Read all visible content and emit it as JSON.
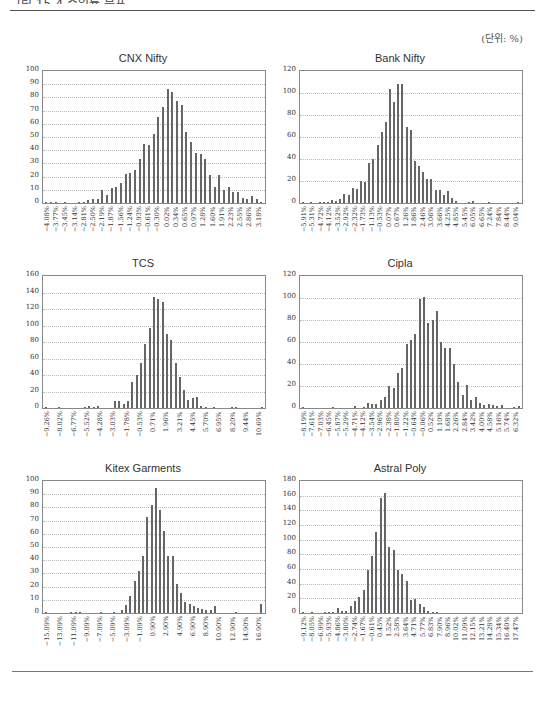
{
  "header": {
    "title_clipped": "그림 15-4 수익률 분포",
    "unit_label": "(단위: %)"
  },
  "chart_data": [
    {
      "id": "cnx",
      "type": "bar",
      "title": "CNX Nifty",
      "ylim": [
        0,
        100
      ],
      "yticks": [
        0,
        10,
        20,
        30,
        40,
        50,
        60,
        70,
        80,
        90,
        100
      ],
      "xlabels": [
        "-4.08%",
        "-3.77%",
        "-3.45%",
        "-3.14%",
        "-2.81%",
        "-2.50%",
        "-2.19%",
        "-1.87%",
        "-1.56%",
        "-1.24%",
        "-0.93%",
        "-0.61%",
        "-0.30%",
        "0.02%",
        "0.34%",
        "0.65%",
        "0.97%",
        "1.28%",
        "1.60%",
        "1.91%",
        "2.23%",
        "2.55%",
        "2.86%",
        "3.18%"
      ],
      "values": [
        1,
        1,
        1,
        0,
        1,
        0,
        0,
        1,
        1,
        2,
        3,
        3,
        10,
        6,
        11,
        12,
        15,
        22,
        23,
        25,
        33,
        45,
        44,
        52,
        65,
        73,
        86,
        84,
        77,
        74,
        54,
        46,
        38,
        37,
        33,
        21,
        12,
        21,
        10,
        12,
        8,
        8,
        4,
        3,
        5,
        3,
        1
      ],
      "grid": true
    },
    {
      "id": "bank",
      "type": "bar",
      "title": "Bank Nifty",
      "ylim": [
        0,
        120
      ],
      "yticks": [
        0,
        20,
        40,
        60,
        80,
        100,
        120
      ],
      "xlabels": [
        "-5.91%",
        "-5.31%",
        "-4.72%",
        "-4.12%",
        "-3.52%",
        "-2.92%",
        "-2.32%",
        "-1.73%",
        "-1.13%",
        "-0.53%",
        "0.07%",
        "0.67%",
        "1.26%",
        "1.86%",
        "2.46%",
        "3.06%",
        "3.66%",
        "4.25%",
        "4.85%",
        "5.45%",
        "6.05%",
        "6.65%",
        "7.24%",
        "7.84%",
        "8.44%",
        "9.04%"
      ],
      "values": [
        1,
        0,
        1,
        0,
        1,
        1,
        1,
        3,
        2,
        4,
        8,
        7,
        14,
        13,
        20,
        19,
        36,
        40,
        53,
        65,
        74,
        104,
        92,
        108,
        108,
        69,
        66,
        38,
        34,
        28,
        22,
        22,
        12,
        12,
        7,
        11,
        5,
        2,
        0,
        0,
        1,
        2,
        0,
        0,
        0,
        1,
        0,
        0,
        0,
        0,
        0,
        0,
        1
      ],
      "grid": true
    },
    {
      "id": "tcs",
      "type": "bar",
      "title": "TCS",
      "ylim": [
        0,
        160
      ],
      "yticks": [
        0,
        20,
        40,
        60,
        80,
        100,
        120,
        140,
        160
      ],
      "xlabels": [
        "-9.26%",
        "-8.02%",
        "-6.77%",
        "-5.52%",
        "-4.28%",
        "-3.03%",
        "-1.78%",
        "-0.53%",
        "0.71%",
        "1.96%",
        "3.21%",
        "4.45%",
        "5.70%",
        "6.95%",
        "8.20%",
        "9.44%",
        "10.69%"
      ],
      "values": [
        1,
        0,
        0,
        1,
        0,
        0,
        0,
        0,
        0,
        1,
        2,
        1,
        2,
        0,
        0,
        0,
        8,
        8,
        5,
        8,
        32,
        40,
        55,
        77,
        97,
        135,
        132,
        129,
        90,
        83,
        55,
        37,
        22,
        10,
        12,
        13,
        3,
        1,
        0,
        1,
        0,
        0,
        0,
        1,
        1,
        0,
        0,
        0,
        0,
        0,
        1
      ],
      "grid": true
    },
    {
      "id": "cipla",
      "type": "bar",
      "title": "Cipla",
      "ylim": [
        0,
        120
      ],
      "yticks": [
        0,
        20,
        40,
        60,
        80,
        100,
        120
      ],
      "xlabels": [
        "-8.19%",
        "-7.61%",
        "-7.03%",
        "-6.45%",
        "-5.87%",
        "-5.29%",
        "-4.71%",
        "-4.12%",
        "-3.54%",
        "-2.96%",
        "-2.38%",
        "-1.80%",
        "-1.22%",
        "-0.64%",
        "-0.06%",
        "0.52%",
        "1.10%",
        "1.68%",
        "2.26%",
        "2.84%",
        "3.42%",
        "4.00%",
        "4.58%",
        "5.16%",
        "5.74%",
        "6.32%"
      ],
      "values": [
        1,
        0,
        0,
        0,
        0,
        0,
        0,
        1,
        0,
        0,
        0,
        0,
        2,
        0,
        1,
        5,
        4,
        4,
        7,
        10,
        20,
        18,
        32,
        36,
        58,
        62,
        67,
        99,
        101,
        77,
        80,
        88,
        60,
        55,
        55,
        40,
        24,
        12,
        21,
        7,
        10,
        5,
        3,
        4,
        3,
        2,
        3,
        0,
        0,
        1,
        2
      ],
      "grid": true
    },
    {
      "id": "kitex",
      "type": "bar",
      "title": "Kitex Garments",
      "ylim": [
        0,
        100
      ],
      "yticks": [
        0,
        10,
        20,
        30,
        40,
        50,
        60,
        70,
        80,
        90,
        100
      ],
      "xlabels": [
        "-15.09%",
        "-13.09%",
        "-11.09%",
        "-9.09%",
        "-7.09%",
        "-5.09%",
        "-3.09%",
        "-1.09%",
        "0.90%",
        "2.90%",
        "4.90%",
        "6.90%",
        "8.90%",
        "10.90%",
        "12.90%",
        "14.90%",
        "16.90%"
      ],
      "values": [
        1,
        0,
        0,
        0,
        0,
        0,
        1,
        1,
        1,
        0,
        0,
        0,
        0,
        1,
        0,
        0,
        1,
        0,
        2,
        6,
        13,
        24,
        32,
        43,
        73,
        82,
        95,
        78,
        62,
        43,
        43,
        22,
        15,
        8,
        7,
        5,
        4,
        3,
        2,
        2,
        5,
        0,
        0,
        0,
        0,
        1,
        0,
        0,
        0,
        0,
        0,
        7
      ],
      "grid": true
    },
    {
      "id": "astral",
      "type": "bar",
      "title": "Astral Poly",
      "ylim": [
        0,
        180
      ],
      "yticks": [
        0,
        20,
        40,
        60,
        80,
        100,
        120,
        140,
        160,
        180
      ],
      "xlabels": [
        "-9.12%",
        "-8.05%",
        "-6.99%",
        "-5.93%",
        "-4.86%",
        "-3.80%",
        "-2.74%",
        "-1.67%",
        "-0.61%",
        "0.45%",
        "1.52%",
        "2.58%",
        "3.64%",
        "4.71%",
        "5.77%",
        "6.83%",
        "7.90%",
        "8.96%",
        "10.02%",
        "11.09%",
        "12.15%",
        "13.21%",
        "14.28%",
        "15.34%",
        "16.40%",
        "17.47%"
      ],
      "values": [
        1,
        0,
        1,
        0,
        0,
        1,
        2,
        1,
        7,
        3,
        3,
        10,
        16,
        22,
        31,
        59,
        78,
        110,
        157,
        164,
        90,
        86,
        59,
        53,
        43,
        18,
        19,
        12,
        8,
        3,
        2,
        1,
        0,
        0,
        0,
        0,
        0,
        0,
        0,
        0,
        0,
        0,
        0,
        0,
        0,
        0,
        0,
        0,
        0,
        0,
        0
      ],
      "grid": true
    }
  ]
}
